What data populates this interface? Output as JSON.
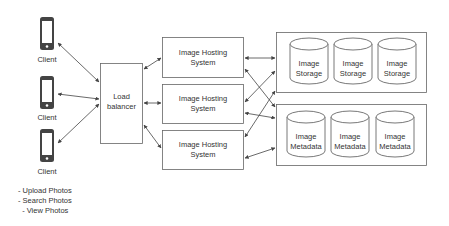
{
  "diagram": {
    "clients": [
      {
        "label": "Client",
        "icon": "smartphone-icon"
      },
      {
        "label": "Client",
        "icon": "smartphone-icon"
      },
      {
        "label": "Client",
        "icon": "smartphone-icon"
      }
    ],
    "load_balancer": {
      "line1": "Load",
      "line2": "balancer"
    },
    "hosting_systems": [
      {
        "line1": "Image Hosting",
        "line2": "System"
      },
      {
        "line1": "Image Hosting",
        "line2": "System"
      },
      {
        "line1": "Image Hosting",
        "line2": "System"
      }
    ],
    "storage": [
      {
        "line1": "Image",
        "line2": "Storage"
      },
      {
        "line1": "Image",
        "line2": "Storage"
      },
      {
        "line1": "Image",
        "line2": "Storage"
      }
    ],
    "metadata": [
      {
        "line1": "Image",
        "line2": "Metadata"
      },
      {
        "line1": "Image",
        "line2": "Metadata"
      },
      {
        "line1": "Image",
        "line2": "Metadata"
      }
    ],
    "notes": [
      "- Upload Photos",
      "- Search Photos",
      "  - View Photos"
    ],
    "colors": {
      "stroke": "#555555",
      "phone": "#444444",
      "text": "#333333",
      "background": "#ffffff"
    }
  }
}
